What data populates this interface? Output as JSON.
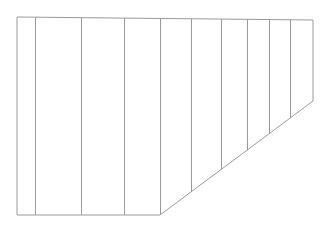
{
  "diagram": {
    "type": "line-drawing",
    "stroke_color": "#9a9a9a",
    "background": "#ffffff",
    "outline": {
      "top_left": [
        17,
        17
      ],
      "top_right": [
        313,
        20
      ],
      "right_bottom": [
        313,
        101
      ],
      "bottom_corner": [
        160,
        215
      ],
      "bottom_left": [
        17,
        215
      ]
    },
    "dividers_x": [
      35,
      81,
      124,
      160,
      191,
      221,
      247,
      269,
      290
    ]
  }
}
